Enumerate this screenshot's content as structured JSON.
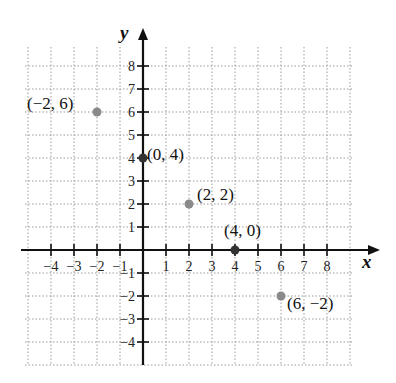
{
  "chart_data": {
    "type": "scatter",
    "title": "",
    "xlabel": "x",
    "ylabel": "y",
    "xlim": [
      -5,
      10
    ],
    "ylim": [
      -5,
      9
    ],
    "grid": true,
    "grid_style": "dotted",
    "x_ticks": [
      -4,
      -3,
      -2,
      -1,
      1,
      2,
      3,
      4,
      5,
      6,
      7,
      8
    ],
    "y_ticks": [
      -4,
      -3,
      -2,
      -1,
      1,
      2,
      3,
      4,
      5,
      6,
      7,
      8
    ],
    "x_tick_labels": [
      "−4",
      "−3",
      "−2",
      "−1",
      "1",
      "2",
      "3",
      "4",
      "5",
      "6",
      "7",
      "8"
    ],
    "y_tick_labels": [
      "−4",
      "−3",
      "−2",
      "−1",
      "1",
      "2",
      "3",
      "4",
      "5",
      "6",
      "7",
      "8"
    ],
    "points": [
      {
        "x": -2,
        "y": 6,
        "label": "(−2, 6)",
        "color": "#8a8a8a"
      },
      {
        "x": 0,
        "y": 4,
        "label": "(0, 4)",
        "color": "#333333"
      },
      {
        "x": 2,
        "y": 2,
        "label": "(2, 2)",
        "color": "#8a8a8a"
      },
      {
        "x": 4,
        "y": 0,
        "label": "(4, 0)",
        "color": "#333333"
      },
      {
        "x": 6,
        "y": -2,
        "label": "(6, −2)",
        "color": "#8a8a8a"
      }
    ],
    "legend": null
  },
  "layout": {
    "origin_px": [
      143,
      250
    ],
    "unit_px": 23,
    "grid_left": 25,
    "grid_right": 352,
    "grid_top": 47,
    "grid_bottom": 365,
    "axis_color": "#111111",
    "grid_color": "#9a9a9a"
  },
  "labels": {
    "x_axis": "x",
    "y_axis": "y",
    "p1": "(−2, 6)",
    "p2": "(0, 4)",
    "p3": "(2, 2)",
    "p4": "(4, 0)",
    "p5": "(6, −2)"
  }
}
